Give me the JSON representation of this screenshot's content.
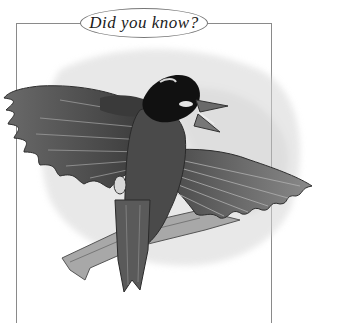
{
  "callout": {
    "title": "Did you know?",
    "frame_color": "#8a8a8a"
  },
  "illustration": {
    "subject": "bird-in-flight",
    "style": "grayscale pencil sketch",
    "description": "Dark-headed bird with outstretched wings flying over a branch"
  }
}
